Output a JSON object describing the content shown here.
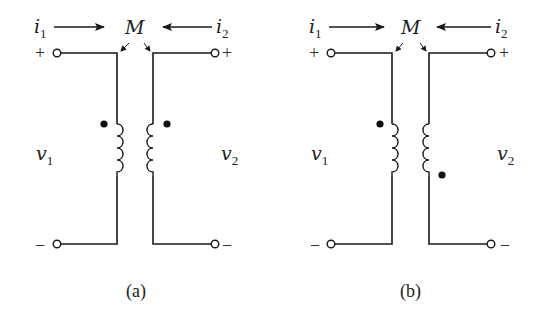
{
  "figure": {
    "panels": [
      {
        "id": "a",
        "caption": "(a)",
        "current_left": {
          "symbol": "i",
          "subscript": "1"
        },
        "current_right": {
          "symbol": "i",
          "subscript": "2"
        },
        "voltage_left": {
          "symbol": "v",
          "subscript": "1"
        },
        "voltage_right": {
          "symbol": "v",
          "subscript": "2"
        },
        "mutual_label": "M",
        "top_left_sign": "+",
        "top_right_sign": "+",
        "bottom_left_sign": "–",
        "bottom_right_sign": "–",
        "dot_convention": "both dots at top of coils"
      },
      {
        "id": "b",
        "caption": "(b)",
        "current_left": {
          "symbol": "i",
          "subscript": "1"
        },
        "current_right": {
          "symbol": "i",
          "subscript": "2"
        },
        "voltage_left": {
          "symbol": "v",
          "subscript": "1"
        },
        "voltage_right": {
          "symbol": "v",
          "subscript": "2"
        },
        "mutual_label": "M",
        "top_left_sign": "+",
        "top_right_sign": "+",
        "bottom_left_sign": "–",
        "bottom_right_sign": "–",
        "dot_convention": "left dot at top, right dot at bottom"
      }
    ]
  }
}
